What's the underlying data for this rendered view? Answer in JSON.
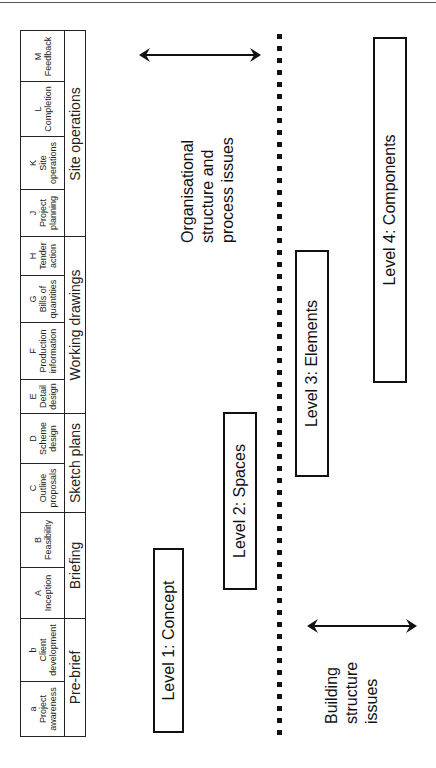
{
  "diagram": {
    "orientation": "rotated 90 degrees counter-clockwise",
    "stages_table": {
      "stages": [
        {
          "code": "a",
          "name": "Project awareness",
          "lines": [
            "a",
            "Project",
            "awareness"
          ]
        },
        {
          "code": "b",
          "name": "Client development",
          "lines": [
            "b",
            "Client",
            "development"
          ]
        },
        {
          "code": "A",
          "name": "Inception",
          "lines": [
            "A",
            "Inception",
            ""
          ]
        },
        {
          "code": "B",
          "name": "Feasibility",
          "lines": [
            "B",
            "Feasibility",
            ""
          ]
        },
        {
          "code": "C",
          "name": "Outline proposals",
          "lines": [
            "C",
            "Outline",
            "proposals"
          ]
        },
        {
          "code": "D",
          "name": "Scheme design",
          "lines": [
            "D",
            "Scheme",
            "design"
          ]
        },
        {
          "code": "E",
          "name": "Detail design",
          "lines": [
            "E",
            "Detail",
            "design"
          ]
        },
        {
          "code": "F",
          "name": "Production information",
          "lines": [
            "F",
            "Production",
            "information"
          ]
        },
        {
          "code": "G",
          "name": "Bills of quantities",
          "lines": [
            "G",
            "Bills of",
            "quantities"
          ]
        },
        {
          "code": "H",
          "name": "Tender action",
          "lines": [
            "H",
            "Tender",
            "action"
          ]
        },
        {
          "code": "J",
          "name": "Project planning",
          "lines": [
            "J",
            "Project",
            "planning"
          ]
        },
        {
          "code": "K",
          "name": "Site operations",
          "lines": [
            "K",
            "Site",
            "operations"
          ]
        },
        {
          "code": "L",
          "name": "Completion",
          "lines": [
            "L",
            "Completion",
            ""
          ]
        },
        {
          "code": "M",
          "name": "Feedback",
          "lines": [
            "M",
            "Feedback",
            ""
          ]
        }
      ],
      "groups": [
        {
          "label": "Pre-brief",
          "spans": [
            "a",
            "b"
          ]
        },
        {
          "label": "Briefing",
          "spans": [
            "A",
            "B"
          ]
        },
        {
          "label": "Sketch plans",
          "spans": [
            "C",
            "D"
          ]
        },
        {
          "label": "Working drawings",
          "spans": [
            "E",
            "F",
            "G",
            "H"
          ]
        },
        {
          "label": "Site operations",
          "spans": [
            "J",
            "K",
            "L",
            "M"
          ]
        }
      ]
    },
    "levels": [
      {
        "label": "Level 1: Concept"
      },
      {
        "label": "Level 2: Spaces"
      },
      {
        "label": "Level 3: Elements"
      },
      {
        "label": "Level 4: Components"
      }
    ],
    "annotations": {
      "organisational": {
        "lines": [
          "Organisational",
          "structure and",
          "process issues"
        ]
      },
      "building": {
        "lines": [
          "Building",
          "structure",
          "issues"
        ]
      }
    },
    "divider": {
      "style": "dotted",
      "separates": [
        "Organisational structure and process issues",
        "Building structure issues"
      ]
    }
  }
}
